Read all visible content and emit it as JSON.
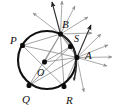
{
  "figure": {
    "colors": {
      "circle_stroke": "#111111",
      "chord_stroke": "#8a8a8a",
      "ray_stroke": "#9a9a9a",
      "ray_dark_stroke": "#2e2e2e",
      "vertex_fill": "#0d0d0d",
      "background": "#ffffff",
      "label_color": "#101010"
    },
    "circle": {
      "center_x": 47,
      "center_y": 60,
      "radius": 29
    },
    "arc": {
      "label": "secondary-arc",
      "path": "M 60 34 C 74 40 80 58 74 80"
    },
    "points": [
      {
        "id": "P",
        "label": "P",
        "x": 22.5,
        "y": 45.5,
        "label_x": 10,
        "label_y": 44,
        "dot": true
      },
      {
        "id": "B",
        "label": "B",
        "x": 60.5,
        "y": 34.0,
        "label_x": 62,
        "label_y": 28,
        "dot": true
      },
      {
        "id": "S",
        "label": "S",
        "x": 70.5,
        "y": 46.5,
        "label_x": 74,
        "label_y": 42,
        "dot": true
      },
      {
        "id": "A",
        "label": "A",
        "x": 77.0,
        "y": 57.5,
        "label_x": 85,
        "label_y": 59,
        "dot": true
      },
      {
        "id": "O",
        "label": "O",
        "x": 44.5,
        "y": 62.0,
        "label_x": 37,
        "label_y": 76,
        "dot": true
      },
      {
        "id": "Q",
        "label": "Q",
        "x": 29.0,
        "y": 85.5,
        "label_x": 22,
        "label_y": 103,
        "dot": true
      },
      {
        "id": "R",
        "label": "R",
        "x": 64.0,
        "y": 86.5,
        "label_x": 66,
        "label_y": 104,
        "dot": true
      }
    ],
    "chords": [
      {
        "name": "chord-P-B",
        "x1": 22.5,
        "y1": 45.5,
        "x2": 60.5,
        "y2": 34.0
      },
      {
        "name": "chord-P-A",
        "x1": 22.5,
        "y1": 45.5,
        "x2": 77.0,
        "y2": 57.5
      },
      {
        "name": "chord-P-R",
        "x1": 22.5,
        "y1": 45.5,
        "x2": 64.0,
        "y2": 86.5
      },
      {
        "name": "chord-Q-B",
        "x1": 29.0,
        "y1": 85.5,
        "x2": 60.5,
        "y2": 34.0
      },
      {
        "name": "chord-Q-A",
        "x1": 29.0,
        "y1": 85.5,
        "x2": 77.0,
        "y2": 57.5
      },
      {
        "name": "chord-Q-S",
        "x1": 29.0,
        "y1": 85.5,
        "x2": 70.5,
        "y2": 46.5
      },
      {
        "name": "chord-R-B",
        "x1": 64.0,
        "y1": 86.5,
        "x2": 60.5,
        "y2": 34.0
      },
      {
        "name": "chord-R-A",
        "x1": 64.0,
        "y1": 86.5,
        "x2": 77.0,
        "y2": 57.5
      },
      {
        "name": "chord-B-A",
        "x1": 60.5,
        "y1": 34.0,
        "x2": 77.0,
        "y2": 57.5
      },
      {
        "name": "chord-B-S",
        "x1": 60.5,
        "y1": 34.0,
        "x2": 70.5,
        "y2": 46.5
      },
      {
        "name": "chord-O-A",
        "x1": 44.5,
        "y1": 62.0,
        "x2": 77.0,
        "y2": 57.5
      },
      {
        "name": "chord-O-B",
        "x1": 44.5,
        "y1": 62.0,
        "x2": 60.5,
        "y2": 34.0
      },
      {
        "name": "chord-O-S",
        "x1": 44.5,
        "y1": 62.0,
        "x2": 70.5,
        "y2": 46.5
      }
    ],
    "rays_from_B": [
      {
        "name": "ray-B-1",
        "to_x": 52,
        "to_y": 2,
        "dark": true
      },
      {
        "name": "ray-B-2",
        "to_x": 62,
        "to_y": 1,
        "dark": false
      },
      {
        "name": "ray-B-3",
        "to_x": 75,
        "to_y": 6,
        "dark": false
      },
      {
        "name": "ray-B-4",
        "to_x": 33,
        "to_y": 13,
        "dark": false
      },
      {
        "name": "ray-B-5",
        "to_x": 88,
        "to_y": 17,
        "dark": false
      },
      {
        "name": "ray-B-6",
        "to_x": 92,
        "to_y": 33,
        "dark": false
      }
    ],
    "rays_from_A": [
      {
        "name": "ray-A-1",
        "to_x": 91,
        "to_y": 25,
        "dark": true
      },
      {
        "name": "ray-A-2",
        "to_x": 101,
        "to_y": 34,
        "dark": false
      },
      {
        "name": "ray-A-3",
        "to_x": 108,
        "to_y": 45,
        "dark": false
      },
      {
        "name": "ray-A-4",
        "to_x": 112,
        "to_y": 57,
        "dark": false
      },
      {
        "name": "ray-A-5",
        "to_x": 107,
        "to_y": 66,
        "dark": false
      },
      {
        "name": "ray-A-6",
        "to_x": 74,
        "to_y": 81,
        "dark": false
      },
      {
        "name": "ray-A-7",
        "to_x": 84,
        "to_y": 92,
        "dark": false
      }
    ]
  }
}
